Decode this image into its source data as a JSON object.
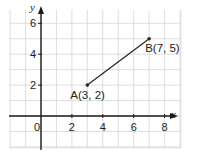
{
  "chart_data": {
    "type": "line",
    "title": "",
    "xlabel": "x",
    "ylabel": "y",
    "xlim": [
      -2,
      9
    ],
    "ylim": [
      -2,
      7
    ],
    "grid": true,
    "x_ticks": [
      {
        "value": 0,
        "label": "0"
      },
      {
        "value": 2,
        "label": "2"
      },
      {
        "value": 4,
        "label": "4"
      },
      {
        "value": 6,
        "label": "6"
      },
      {
        "value": 8,
        "label": "8"
      }
    ],
    "y_ticks": [
      {
        "value": 2,
        "label": "2"
      },
      {
        "value": 4,
        "label": "4"
      },
      {
        "value": 6,
        "label": "6"
      }
    ],
    "series": [
      {
        "name": "segment AB",
        "points": [
          {
            "name": "A",
            "x": 3,
            "y": 2,
            "label": "A(3, 2)",
            "label_pos": "below-left"
          },
          {
            "name": "B",
            "x": 7,
            "y": 5,
            "label": "B(7, 5)",
            "label_pos": "below-right"
          }
        ]
      }
    ],
    "colors": {
      "grid": "#d6d6d6",
      "axis": "#1a1a1a",
      "line": "#2a2a2a"
    }
  }
}
